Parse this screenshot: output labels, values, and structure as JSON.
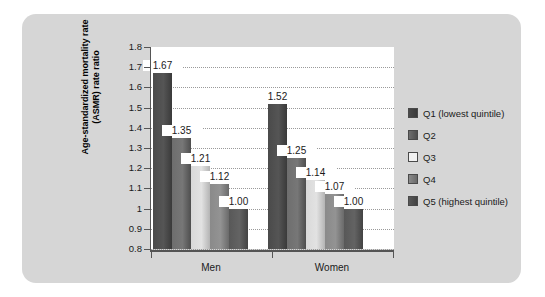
{
  "chart_data": {
    "type": "bar",
    "title": "",
    "xlabel": "",
    "ylabel": "Age-standardized mortality rate\n(ASMR) rate ratio",
    "ylabel_line1": "Age-standardized mortality rate",
    "ylabel_line2": "(ASMR) rate ratio",
    "categories": [
      "Men",
      "Women"
    ],
    "ylim": [
      0.8,
      1.8
    ],
    "ytick_labels": [
      "1.8",
      "1.7",
      "1.6",
      "1.5",
      "1.4",
      "1.3",
      "1.2",
      "1.1",
      "1",
      "0.9",
      "0.8"
    ],
    "ytick_values": [
      1.8,
      1.7,
      1.6,
      1.5,
      1.4,
      1.3,
      1.2,
      1.1,
      1.0,
      0.9,
      0.8
    ],
    "grid": true,
    "legend_position": "right",
    "series": [
      {
        "name": "Q1 (lowest quintile)",
        "key": "q1",
        "color": "#4a4a4a",
        "values": [
          1.67,
          1.52
        ],
        "labels": [
          "1.67",
          "1.52"
        ]
      },
      {
        "name": "Q2",
        "key": "q2",
        "color": "#6e6e6e",
        "values": [
          1.35,
          1.25
        ],
        "labels": [
          "1.35",
          "1.25"
        ]
      },
      {
        "name": "Q3",
        "key": "q3",
        "color": "#e2e2e2",
        "values": [
          1.21,
          1.14
        ],
        "labels": [
          "1.21",
          "1.14"
        ]
      },
      {
        "name": "Q4",
        "key": "q4",
        "color": "#8a8a8a",
        "values": [
          1.12,
          1.07
        ],
        "labels": [
          "1.12",
          "1.07"
        ]
      },
      {
        "name": "Q5 (highest quintile)",
        "key": "q5",
        "color": "#585858",
        "values": [
          1.0,
          1.0
        ],
        "labels": [
          "1.00",
          "1.00"
        ]
      }
    ]
  },
  "legend": {
    "items": [
      {
        "label": "Q1 (lowest quintile)",
        "key": "q1"
      },
      {
        "label": "Q2",
        "key": "q2"
      },
      {
        "label": "Q3",
        "key": "q3"
      },
      {
        "label": "Q4",
        "key": "q4"
      },
      {
        "label": "Q5 (highest quintile)",
        "key": "q5"
      }
    ]
  },
  "colors": {
    "panel_background": "#d6d6d6",
    "plot_background": "#ffffff",
    "axis": "#555555",
    "gridline": "#9a9a9a",
    "text": "#1a1a1a"
  }
}
